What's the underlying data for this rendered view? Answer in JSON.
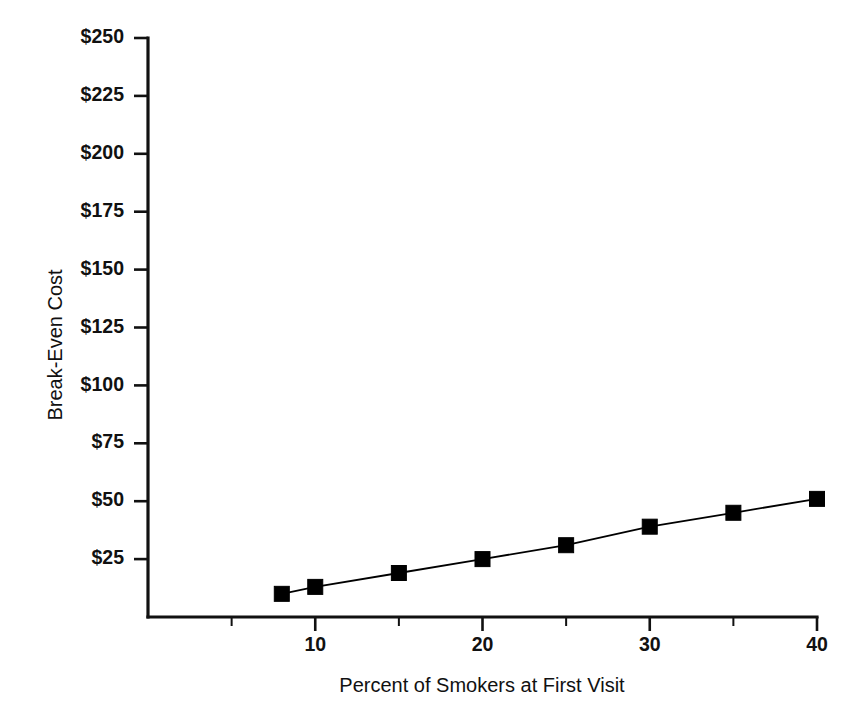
{
  "chart_data": {
    "type": "line",
    "title": "",
    "xlabel": "Percent of Smokers at First Visit",
    "ylabel": "Break-Even Cost",
    "x": [
      8,
      10,
      15,
      20,
      25,
      30,
      35,
      40
    ],
    "values": [
      10,
      13,
      19,
      25,
      31,
      39,
      45,
      51
    ],
    "series": [
      {
        "name": "Break-Even Cost",
        "values": [
          10,
          13,
          19,
          25,
          31,
          39,
          45,
          51
        ]
      }
    ],
    "xlim": [
      0,
      40
    ],
    "ylim": [
      0,
      250
    ],
    "y_tick_values": [
      25,
      50,
      75,
      100,
      125,
      150,
      175,
      200,
      225,
      250
    ],
    "y_tick_labels": [
      "$25",
      "$50",
      "$75",
      "$100",
      "$125",
      "$150",
      "$175",
      "$200",
      "$225",
      "$250"
    ],
    "x_tick_values": [
      10,
      20,
      30,
      40
    ],
    "x_tick_labels": [
      "10",
      "20",
      "30",
      "40"
    ],
    "x_minor_ticks": [
      5,
      15,
      25,
      35
    ],
    "grid": false,
    "legend": "none",
    "marker": "square",
    "marker_color": "#000000",
    "line_color": "#000000",
    "background_color": "#ffffff"
  },
  "axes": {
    "y_title": "Break-Even Cost",
    "x_title": "Percent of Smokers at First Visit"
  }
}
